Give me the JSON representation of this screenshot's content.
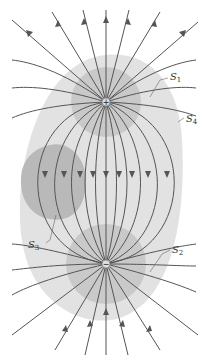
{
  "diagram": {
    "charges": [
      {
        "id": "positive",
        "symbol": "+",
        "x": 106,
        "y": 102
      },
      {
        "id": "negative",
        "symbol": "−",
        "x": 106,
        "y": 264
      }
    ],
    "surfaces": [
      {
        "id": "S1",
        "label": "S",
        "sub": "1",
        "encloses": "positive charge"
      },
      {
        "id": "S2",
        "label": "S",
        "sub": "2",
        "encloses": "negative charge"
      },
      {
        "id": "S3",
        "label": "S",
        "sub": "3",
        "encloses": "no charge"
      },
      {
        "id": "S4",
        "label": "S",
        "sub": "4",
        "encloses": "both charges"
      }
    ],
    "colors": {
      "background": "#ffffff",
      "s4_fill": "#e2e2e2",
      "s12_fill": "#c8c8c8",
      "s3_fill": "#b4b4b4",
      "field_line": "#555555",
      "charge": "#dddddd"
    }
  }
}
